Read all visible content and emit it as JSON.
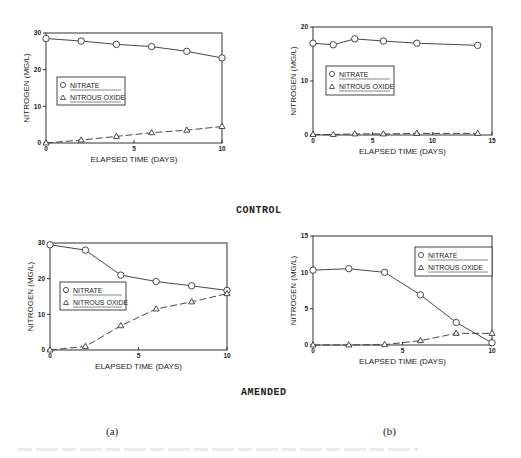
{
  "labels": {
    "control": "CONTROL",
    "amended": "AMENDED",
    "panel_a": "(a)",
    "panel_b": "(b)"
  },
  "chart_data": [
    {
      "id": "control-a",
      "type": "line",
      "title": "",
      "group": "CONTROL",
      "panel": "(a)",
      "xlabel": "ELAPSED TIME (DAYS)",
      "ylabel": "NITROGEN (MG/L)",
      "xlim": [
        0,
        10
      ],
      "ylim": [
        0,
        30
      ],
      "xticks": [
        0,
        5,
        10
      ],
      "yticks": [
        0,
        10,
        20,
        30
      ],
      "grid": false,
      "legend_position": "center-left",
      "series": [
        {
          "name": "NITRATE",
          "marker": "circle",
          "line": "solid",
          "x": [
            0,
            2,
            4,
            6,
            8,
            10
          ],
          "y": [
            28.5,
            27.8,
            26.9,
            26.3,
            25.0,
            23.2
          ]
        },
        {
          "name": "NITROUS OXIDE",
          "marker": "triangle",
          "line": "dashed",
          "x": [
            0,
            2,
            4,
            6,
            8,
            10
          ],
          "y": [
            0,
            0.8,
            1.8,
            2.8,
            3.5,
            4.5
          ]
        }
      ]
    },
    {
      "id": "control-b",
      "type": "line",
      "title": "",
      "group": "CONTROL",
      "panel": "(b)",
      "xlabel": "ELAPSED TIME (DAYS)",
      "ylabel": "NITROGEN (MG/L)",
      "xlim": [
        0,
        15
      ],
      "ylim": [
        0,
        20
      ],
      "xticks": [
        0,
        5,
        10,
        15
      ],
      "yticks": [
        0,
        10,
        20
      ],
      "grid": false,
      "legend_position": "center-left",
      "series": [
        {
          "name": "NITRATE",
          "marker": "circle",
          "line": "solid",
          "x": [
            0,
            1.7,
            3.5,
            5.9,
            8.7,
            13.8
          ],
          "y": [
            17.0,
            16.7,
            17.8,
            17.4,
            17.0,
            16.6
          ]
        },
        {
          "name": "NITROUS OXIDE",
          "marker": "triangle",
          "line": "dashed",
          "x": [
            0,
            1.7,
            3.5,
            5.9,
            8.7,
            13.8
          ],
          "y": [
            0.1,
            0.1,
            0.2,
            0.2,
            0.3,
            0.3
          ]
        }
      ]
    },
    {
      "id": "amended-a",
      "type": "line",
      "title": "",
      "group": "AMENDED",
      "panel": "(a)",
      "xlabel": "ELAPSED TIME (DAYS)",
      "ylabel": "NITROGEN (MG/L)",
      "xlim": [
        0,
        10
      ],
      "ylim": [
        0,
        30
      ],
      "xticks": [
        0,
        5,
        10
      ],
      "yticks": [
        0,
        10,
        20,
        30
      ],
      "grid": false,
      "legend_position": "center-left",
      "series": [
        {
          "name": "NITRATE",
          "marker": "square-circle",
          "line": "solid",
          "x": [
            0,
            2,
            4,
            6,
            8,
            10
          ],
          "y": [
            29.5,
            28.0,
            21.0,
            19.2,
            18.0,
            16.7
          ]
        },
        {
          "name": "NITROUS OXIDE",
          "marker": "triangle",
          "line": "dashed",
          "x": [
            0,
            2,
            4,
            6,
            8,
            10
          ],
          "y": [
            0,
            1.0,
            6.8,
            11.5,
            13.5,
            15.8
          ]
        }
      ]
    },
    {
      "id": "amended-b",
      "type": "line",
      "title": "",
      "group": "AMENDED",
      "panel": "(b)",
      "xlabel": "ELAPSED TIME (DAYS)",
      "ylabel": "NITROGEN (MG/L)",
      "xlim": [
        0,
        10
      ],
      "ylim": [
        0,
        15
      ],
      "xticks": [
        0,
        5,
        10
      ],
      "yticks": [
        0,
        5,
        10,
        15
      ],
      "grid": false,
      "legend_position": "upper-right",
      "series": [
        {
          "name": "NITRATE",
          "marker": "circle",
          "line": "solid",
          "x": [
            0,
            2,
            4,
            6,
            8,
            10
          ],
          "y": [
            10.3,
            10.5,
            10.0,
            6.9,
            3.1,
            0.3
          ]
        },
        {
          "name": "NITROUS OXIDE",
          "marker": "triangle",
          "line": "dashed",
          "x": [
            0,
            2,
            4,
            6,
            8,
            10
          ],
          "y": [
            0,
            0,
            0.05,
            0.6,
            1.6,
            1.6
          ]
        }
      ]
    }
  ],
  "layout": {
    "plots": [
      {
        "x0": 46,
        "x1": 222,
        "y0": 143,
        "y1": 33,
        "legend": {
          "x": 57,
          "y": 77,
          "w": 68,
          "h": 28
        }
      },
      {
        "x0": 313,
        "x1": 492,
        "y0": 135,
        "y1": 27,
        "legend": {
          "x": 326,
          "y": 66,
          "w": 68,
          "h": 29
        }
      },
      {
        "x0": 50,
        "x1": 227,
        "y0": 350,
        "y1": 243,
        "legend": {
          "x": 60,
          "y": 282,
          "w": 66,
          "h": 28
        }
      },
      {
        "x0": 313,
        "x1": 492,
        "y0": 345,
        "y1": 236,
        "legend": {
          "x": 415,
          "y": 247,
          "w": 77,
          "h": 29
        }
      }
    ]
  }
}
